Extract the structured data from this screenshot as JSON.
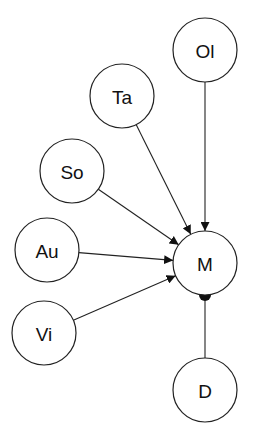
{
  "diagram": {
    "nodes": [
      {
        "id": "Ol",
        "label": "Ol"
      },
      {
        "id": "Ta",
        "label": "Ta"
      },
      {
        "id": "So",
        "label": "So"
      },
      {
        "id": "Au",
        "label": "Au"
      },
      {
        "id": "Vi",
        "label": "Vi"
      },
      {
        "id": "M",
        "label": "M"
      },
      {
        "id": "D",
        "label": "D"
      }
    ],
    "edges": [
      {
        "from": "Ol",
        "to": "M",
        "type": "arrow"
      },
      {
        "from": "Ta",
        "to": "M",
        "type": "arrow"
      },
      {
        "from": "So",
        "to": "M",
        "type": "arrow"
      },
      {
        "from": "Au",
        "to": "M",
        "type": "arrow"
      },
      {
        "from": "Vi",
        "to": "M",
        "type": "arrow"
      },
      {
        "from": "D",
        "to": "M",
        "type": "dot"
      }
    ]
  }
}
